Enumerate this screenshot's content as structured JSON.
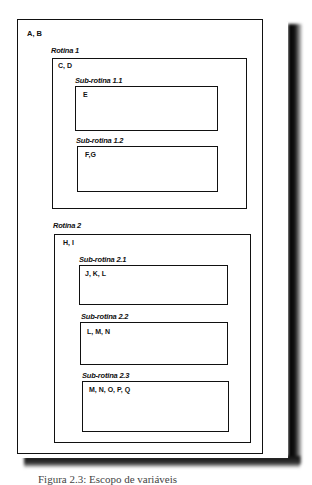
{
  "diagram": {
    "outer": {
      "vars": "A, B"
    },
    "routines": [
      {
        "label": "Rotina 1",
        "vars": "C, D",
        "subroutines": [
          {
            "label": "Sub-rotina 1.1",
            "vars": "E"
          },
          {
            "label": "Sub-rotina 1.2",
            "vars": "F,G"
          }
        ]
      },
      {
        "label": "Rotina 2",
        "vars": "H, I",
        "subroutines": [
          {
            "label": "Sub-rotina 2.1",
            "vars": "J, K, L"
          },
          {
            "label": "Sub-rotina 2.2",
            "vars": "L, M, N"
          },
          {
            "label": "Sub-rotina 2.3",
            "vars": "M, N, O, P, Q"
          }
        ]
      }
    ]
  },
  "caption": "Figura 2.3: Escopo de variáveis"
}
